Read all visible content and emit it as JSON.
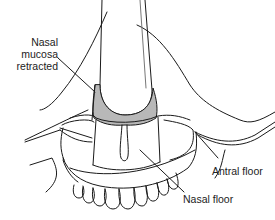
{
  "figure": {
    "type": "anatomical-line-drawing",
    "fill_color": "#b8b8b8",
    "line_color": "#1a1a1a"
  },
  "labels": {
    "nasal_mucosa": {
      "line1": "Nasal",
      "line2": "mucosa",
      "line3": "retracted"
    },
    "antral_floor": "Antral floor",
    "nasal_floor": "Nasal floor"
  }
}
